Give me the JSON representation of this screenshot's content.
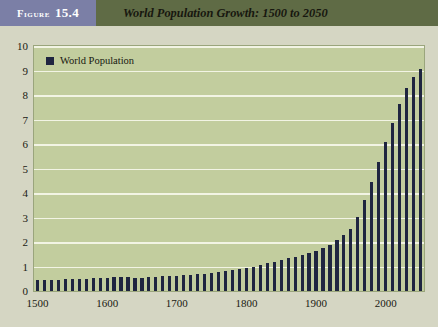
{
  "header": {
    "figure_word": "Figure",
    "figure_number": "15.4",
    "title": "World Population Growth: 1500 to 2050",
    "tag_bg": "#7b7fa6",
    "band_bg": "#5f6b45"
  },
  "legend": {
    "items": [
      {
        "label": "World Population",
        "color": "#1f2540",
        "marker": "square-swatch"
      }
    ]
  },
  "chart_data": {
    "type": "bar",
    "title": "World Population Growth: 1500 to 2050",
    "xlabel": "",
    "ylabel": "",
    "ylim": [
      0,
      10
    ],
    "xlim": [
      1495,
      2055
    ],
    "grid": true,
    "legend_position": "top-left-inside",
    "series_name": "World Population",
    "series_color": "#1f2540",
    "plot_bg": "#c2cd9e",
    "gridline_color": "#f2f4e4",
    "y_ticks": [
      0,
      1,
      2,
      3,
      4,
      5,
      6,
      7,
      8,
      9,
      10
    ],
    "y_tick_labels": [
      "0",
      "1",
      "2",
      "3",
      "4",
      "5",
      "6",
      "7",
      "8",
      "9",
      "10"
    ],
    "x_ticks": [
      1500,
      1600,
      1700,
      1800,
      1900,
      2000
    ],
    "x_tick_labels": [
      "1500",
      "1600",
      "1700",
      "1800",
      "1900",
      "2000"
    ],
    "units_note": "billions of people",
    "x": [
      1500,
      1510,
      1520,
      1530,
      1540,
      1550,
      1560,
      1570,
      1580,
      1590,
      1600,
      1610,
      1620,
      1630,
      1640,
      1650,
      1660,
      1670,
      1680,
      1690,
      1700,
      1710,
      1720,
      1730,
      1740,
      1750,
      1760,
      1770,
      1780,
      1790,
      1800,
      1810,
      1820,
      1830,
      1840,
      1850,
      1860,
      1870,
      1880,
      1890,
      1900,
      1910,
      1920,
      1930,
      1940,
      1950,
      1960,
      1970,
      1980,
      1990,
      2000,
      2010,
      2020,
      2030,
      2040,
      2050
    ],
    "values": [
      0.44,
      0.45,
      0.46,
      0.47,
      0.48,
      0.49,
      0.5,
      0.51,
      0.52,
      0.53,
      0.55,
      0.56,
      0.57,
      0.58,
      0.55,
      0.55,
      0.56,
      0.58,
      0.6,
      0.61,
      0.62,
      0.64,
      0.66,
      0.68,
      0.7,
      0.73,
      0.77,
      0.81,
      0.86,
      0.9,
      0.95,
      1.0,
      1.06,
      1.13,
      1.2,
      1.26,
      1.33,
      1.39,
      1.46,
      1.55,
      1.65,
      1.75,
      1.86,
      2.07,
      2.3,
      2.52,
      3.02,
      3.7,
      4.44,
      5.27,
      6.07,
      6.85,
      7.63,
      8.3,
      8.75,
      9.05
    ]
  }
}
